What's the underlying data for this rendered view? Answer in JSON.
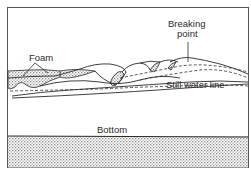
{
  "diagram": {
    "type": "breaking wave profile diagram",
    "labels": {
      "foam": "Foam",
      "breaking_point_line1": "Breaking",
      "breaking_point_line2": "point",
      "still_water_line": "Still water line",
      "bottom": "Bottom"
    },
    "colors": {
      "line": "#2a2a2a",
      "frame": "#555555",
      "stipple": "#9a9a9a",
      "background": "#ffffff"
    }
  }
}
